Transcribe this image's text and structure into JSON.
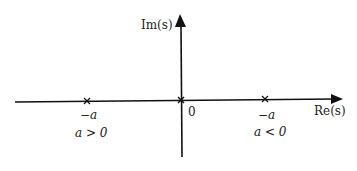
{
  "diagram": {
    "type": "s-plane pole diagram",
    "axes": {
      "imaginary_label": "Im(s)",
      "real_label": "Re(s)",
      "origin_label": "0"
    },
    "poles": [
      {
        "position": "left",
        "value_label": "−a",
        "condition_label": "a > 0"
      },
      {
        "position": "origin",
        "value_label": "0",
        "condition_label": ""
      },
      {
        "position": "right",
        "value_label": "−a",
        "condition_label": "a < 0"
      }
    ],
    "colors": {
      "axis": "#111111",
      "text": "#222222",
      "background": "#ffffff"
    }
  }
}
